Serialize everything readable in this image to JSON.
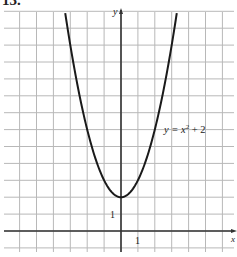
{
  "problem_number": "13.",
  "chart_data": {
    "type": "line",
    "title": "",
    "function": "y = x^2 + 2",
    "series": [
      {
        "name": "y = x² + 2",
        "x": [
          -3.3,
          -3,
          -2.5,
          -2,
          -1.5,
          -1,
          -0.5,
          0,
          0.5,
          1,
          1.5,
          2,
          2.5,
          3,
          3.3
        ],
        "y": [
          12.89,
          11,
          8.25,
          6,
          4.25,
          3,
          2.25,
          2,
          2.25,
          3,
          4.25,
          6,
          8.25,
          11,
          12.89
        ]
      }
    ],
    "annotations": [
      {
        "text": "y = x² + 2",
        "x": 2.6,
        "y": 6
      }
    ],
    "xlabel": "x",
    "ylabel": "y",
    "tick_labels": {
      "x": [
        "1"
      ],
      "y": [
        "1"
      ]
    },
    "xlim": [
      -7,
      6.8
    ],
    "ylim": [
      -1,
      12.9
    ],
    "grid": true,
    "grid_step": 1,
    "legend": "none"
  },
  "labels": {
    "curve": "y = x",
    "curve_sup": "2",
    "curve_tail": " + 2",
    "x_axis": "x",
    "y_axis": "y",
    "x_tick": "1",
    "y_tick": "1"
  },
  "colors": {
    "grid": "#b8b8b8",
    "axis": "#333333",
    "curve": "#1a1a1a"
  }
}
